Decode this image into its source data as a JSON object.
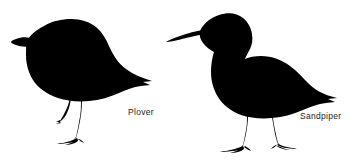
{
  "figure": {
    "background_color": "#ffffff",
    "silhouette_color": "#000000",
    "caption_color": "#1a1a1a"
  },
  "birds": [
    {
      "id": "plover",
      "label": "Plover",
      "bill": "short stubby bill",
      "posture": "standing, head turned left, one leg lifted",
      "tail": "forked pointed tail to the right"
    },
    {
      "id": "sandpiper",
      "label": "Sandpiper",
      "bill": "long slender pointed bill",
      "posture": "standing on two legs, head lowered left",
      "tail": "forked pointed tail to the right"
    }
  ]
}
